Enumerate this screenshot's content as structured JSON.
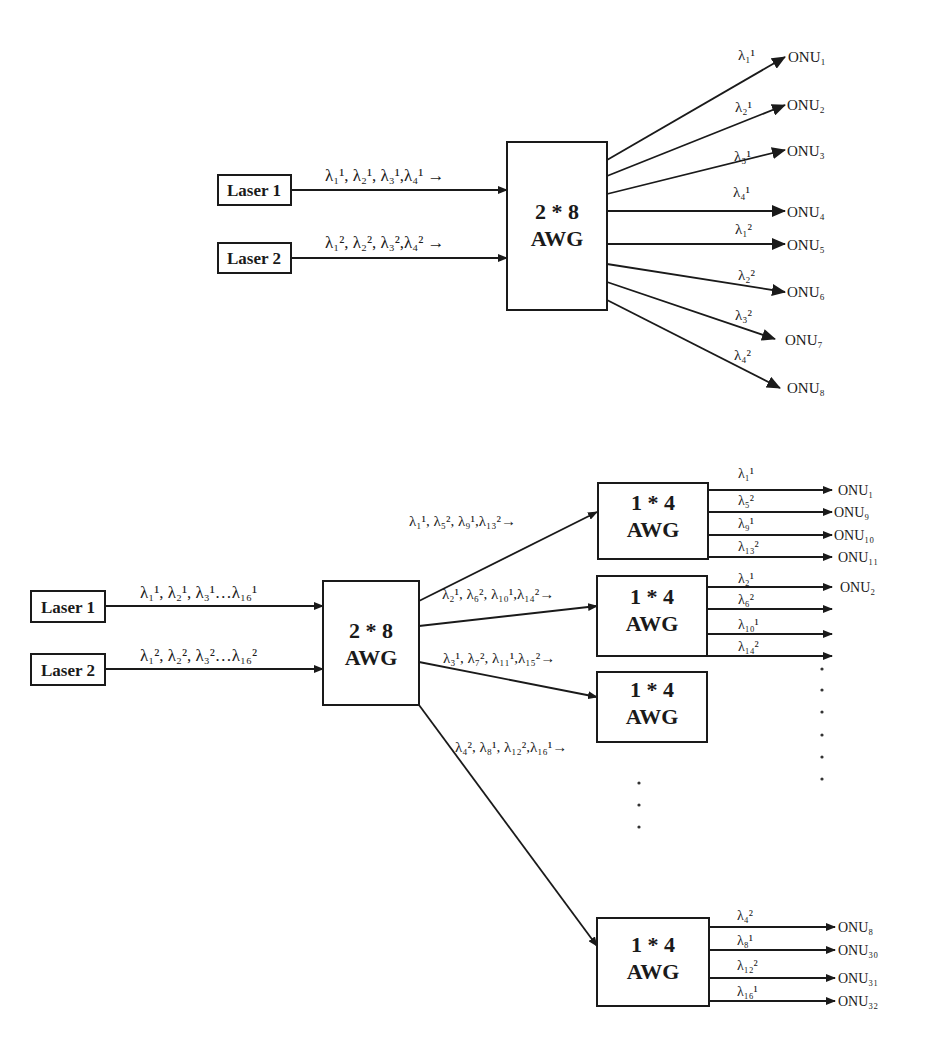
{
  "top_diagram": {
    "lasers": [
      {
        "label": "Laser 1",
        "wavelengths": "λ₁¹, λ₂¹, λ₃¹,λ₄¹ →"
      },
      {
        "label": "Laser 2",
        "wavelengths": "λ₁², λ₂², λ₃²,λ₄² →"
      }
    ],
    "awg": {
      "line1": "2 * 8",
      "line2": "AWG"
    },
    "outputs": [
      {
        "wavelength": "λ₁¹",
        "onu": "ONU₁"
      },
      {
        "wavelength": "λ₂¹",
        "onu": "ONU₂"
      },
      {
        "wavelength": "λ₃¹",
        "onu": "ONU₃"
      },
      {
        "wavelength": "λ₄¹",
        "onu": "ONU₄"
      },
      {
        "wavelength": "λ₁²",
        "onu": "ONU₅"
      },
      {
        "wavelength": "λ₂²",
        "onu": "ONU₆"
      },
      {
        "wavelength": "λ₃²",
        "onu": "ONU₇"
      },
      {
        "wavelength": "λ₄²",
        "onu": "ONU₈"
      }
    ]
  },
  "bottom_diagram": {
    "lasers": [
      {
        "label": "Laser 1",
        "wavelengths": "λ₁¹, λ₂¹, λ₃¹…λ₁₆¹"
      },
      {
        "label": "Laser 2",
        "wavelengths": "λ₁², λ₂², λ₃²…λ₁₆²"
      }
    ],
    "main_awg": {
      "line1": "2 * 8",
      "line2": "AWG"
    },
    "branches": [
      {
        "wavelengths": "λ₁¹, λ₅², λ₉¹,λ₁₃²→"
      },
      {
        "wavelengths": "λ₂¹, λ₆², λ₁₀¹,λ₁₄²→"
      },
      {
        "wavelengths": "λ₃¹, λ₇², λ₁₁¹,λ₁₅²→"
      },
      {
        "wavelengths": "λ₄², λ₈¹, λ₁₂²,λ₁₆¹→"
      }
    ],
    "sub_awgs": [
      {
        "line1": "1 * 4",
        "line2": "AWG",
        "outputs": [
          {
            "wavelength": "λ₁¹",
            "onu": "ONU₁"
          },
          {
            "wavelength": "λ₅²",
            "onu": "ONU₉"
          },
          {
            "wavelength": "λ₉¹",
            "onu": "ONU₁₀"
          },
          {
            "wavelength": "λ₁₃²",
            "onu": "ONU₁₁"
          }
        ]
      },
      {
        "line1": "1 * 4",
        "line2": "AWG",
        "outputs": [
          {
            "wavelength": "λ₂¹",
            "onu": "ONU₂"
          },
          {
            "wavelength": "λ₆²",
            "onu": ""
          },
          {
            "wavelength": "λ₁₀¹",
            "onu": ""
          },
          {
            "wavelength": "λ₁₄²",
            "onu": ""
          }
        ]
      },
      {
        "line1": "1 * 4",
        "line2": "AWG",
        "outputs": []
      },
      {
        "line1": "1 * 4",
        "line2": "AWG",
        "outputs": [
          {
            "wavelength": "λ₄²",
            "onu": "ONU₈"
          },
          {
            "wavelength": "λ₈¹",
            "onu": "ONU₃₀"
          },
          {
            "wavelength": "λ₁₂²",
            "onu": "ONU₃₁"
          },
          {
            "wavelength": "λ₁₆¹",
            "onu": "ONU₃₂"
          }
        ]
      }
    ],
    "ellipsis": "⋮"
  }
}
